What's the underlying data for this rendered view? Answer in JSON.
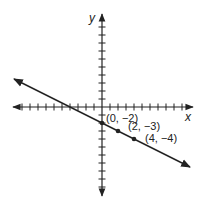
{
  "chart_data": {
    "type": "line",
    "title": "",
    "xlabel": "x",
    "ylabel": "y",
    "xlim": [
      -11,
      11
    ],
    "ylim": [
      -11,
      11
    ],
    "grid": false,
    "tick_interval": 1,
    "series": [
      {
        "name": "line",
        "slope": -0.5,
        "intercept": -2,
        "x": [
          -11,
          11
        ],
        "y": [
          3.5,
          -7.5
        ],
        "arrows": "both"
      }
    ],
    "points": [
      {
        "x": 0,
        "y": -2,
        "label": "(0, −2)"
      },
      {
        "x": 2,
        "y": -3,
        "label": "(2, −3)"
      },
      {
        "x": 4,
        "y": -4,
        "label": "(4, −4)"
      }
    ]
  },
  "labels": {
    "x_axis": "x",
    "y_axis": "y",
    "p0": "(0, −2)",
    "p1": "(2, −3)",
    "p2": "(4, −4)"
  },
  "colors": {
    "ink": "#222222",
    "background": "#ffffff"
  }
}
